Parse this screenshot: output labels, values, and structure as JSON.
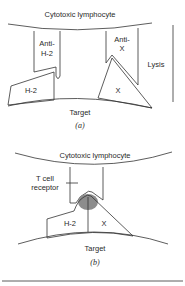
{
  "panel_a": {
    "cell_top_label": "Cytotoxic lymphocyte",
    "receptor_left_label_line1": "Anti-",
    "receptor_left_label_line2": "H-2",
    "receptor_right_label_line1": "Anti-",
    "receptor_right_label_line2": "X",
    "antigen_left_label": "H-2",
    "antigen_right_label": "X",
    "outcome_label": "Lysis",
    "cell_bottom_label": "Target",
    "caption": "(a)"
  },
  "panel_b": {
    "cell_top_label": "Cytotoxic lymphocyte",
    "receptor_label_line1": "T cell",
    "receptor_label_line2": "receptor",
    "antigen_left_label": "H-2",
    "antigen_right_label": "X",
    "cell_bottom_label": "Target",
    "caption": "(b)"
  },
  "colors": {
    "line": "#333333",
    "binding_site": "#8c8c8c"
  }
}
